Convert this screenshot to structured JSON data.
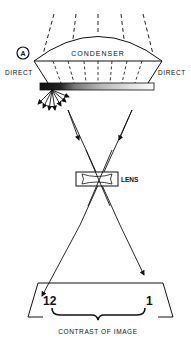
{
  "diagram": {
    "panel_label": "A",
    "condenser_label": "CONDENSER",
    "direct_left_label": "DIRECT",
    "direct_right_label": "DIRECT",
    "lens_label": "LENS",
    "image_left_value": "12",
    "image_right_value": "1",
    "caption": "CONTRAST OF IMAGE"
  }
}
